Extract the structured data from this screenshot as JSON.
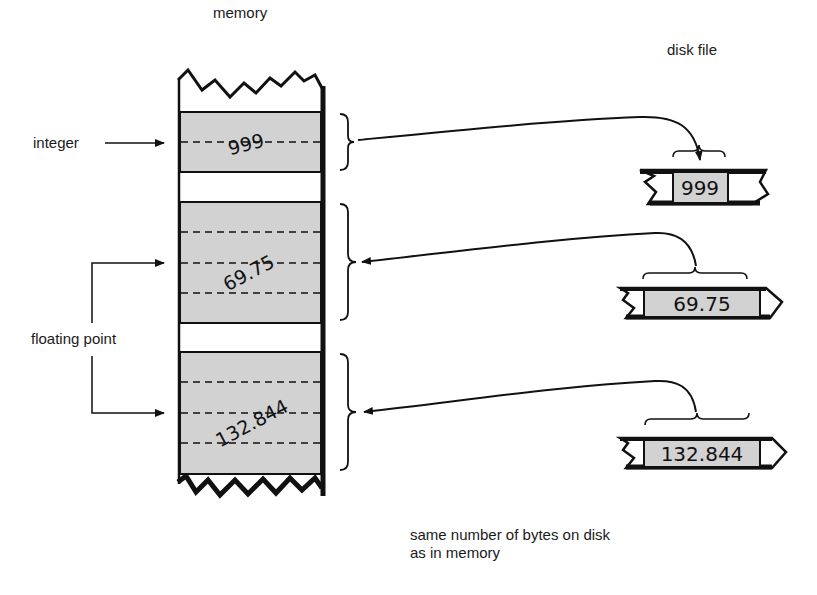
{
  "labels": {
    "memory": "memory",
    "disk_file": "disk file",
    "integer": "integer",
    "floating_point": "floating point",
    "caption_line1": "same number of bytes on disk",
    "caption_line2": "as in memory"
  },
  "memory_values": {
    "integer": "999",
    "float1": "69.75",
    "float2": "132.844"
  },
  "disk_values": {
    "integer": "999",
    "float1": "69.75",
    "float2": "132.844"
  },
  "colors": {
    "cell_fill": "#d2d2d2",
    "ink": "#111111",
    "background": "#ffffff"
  }
}
